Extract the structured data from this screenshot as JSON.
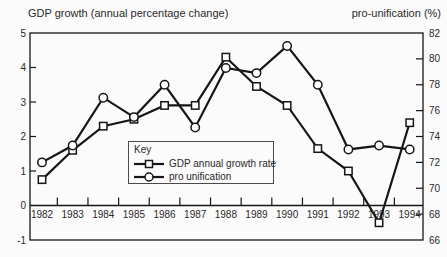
{
  "titles": {
    "left_axis": "GDP growth (annual percentage change)",
    "right_axis": "pro-unification (%)"
  },
  "legend": {
    "title": "Key"
  },
  "chart_data": {
    "type": "line",
    "x_categories": [
      "1982",
      "1983",
      "1984",
      "1985",
      "1986",
      "1987",
      "1988",
      "1989",
      "1990",
      "1991",
      "1992",
      "1993",
      "1994"
    ],
    "series": [
      {
        "name": "GDP annual growth rate",
        "axis": "left",
        "marker": "square",
        "values": [
          0.75,
          1.6,
          2.3,
          2.5,
          2.9,
          2.9,
          4.3,
          3.45,
          2.9,
          1.65,
          1.0,
          -0.5,
          2.4
        ]
      },
      {
        "name": "pro unification",
        "axis": "right",
        "marker": "circle",
        "values": [
          72,
          73.3,
          77,
          75.5,
          78,
          74.7,
          79.3,
          78.9,
          81,
          78,
          73,
          73.3,
          73
        ]
      }
    ],
    "left_axis": {
      "title": "GDP growth (annual percentage change)",
      "range": [
        -1,
        5
      ],
      "ticks": [
        5,
        4,
        3,
        2,
        1,
        0,
        -1
      ]
    },
    "right_axis": {
      "title": "pro-unification (%)",
      "range": [
        66,
        82
      ],
      "ticks": [
        82,
        80,
        78,
        76,
        74,
        72,
        70,
        68,
        66
      ]
    },
    "zero_line": true,
    "legend_position": "inside-bottom-center",
    "line_color": "#161616",
    "marker_fill": "#ffffff",
    "text_color": "#2a2a2a",
    "background": "#fbfbfb"
  }
}
